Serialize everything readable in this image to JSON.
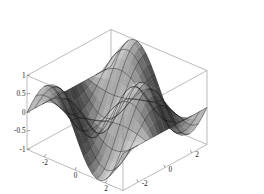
{
  "figure": {
    "kind": "3d-surface-plot",
    "background_color": "#ffffff",
    "box_line_color": "#8d8d8d",
    "mesh_line_color": "#151515",
    "surface_shade_light": "#cfcfcf",
    "surface_shade_dark": "#2a2a2a",
    "width": 264,
    "height": 194
  },
  "chart_data": {
    "type": "surface",
    "title": "",
    "xlabel": "",
    "ylabel": "",
    "zlabel": "",
    "grid": false,
    "legend": "none",
    "function": "sin(x) * cos(y)",
    "xlim": [
      -3.141592653589793,
      3.141592653589793
    ],
    "ylim": [
      -3.141592653589793,
      3.141592653589793
    ],
    "zlim": [
      -1,
      1
    ],
    "x_ticks": [
      -2,
      0,
      2
    ],
    "x_tick_labels": [
      "-2",
      "0",
      "2"
    ],
    "y_ticks": [
      -2,
      0,
      2
    ],
    "y_tick_labels": [
      "2",
      "0",
      "-2"
    ],
    "z_ticks": [
      1,
      0.5,
      0,
      -0.5,
      -1
    ],
    "z_tick_labels": [
      "1",
      "0.5",
      "0",
      "-0.5",
      "-1"
    ],
    "mesh_steps_x": 22,
    "mesh_steps_y": 22,
    "view": {
      "azimuth_deg": -37,
      "elevation_deg": 22
    }
  },
  "axes": {
    "z_axis": {
      "name": "z-axis",
      "ticks": [
        {
          "value": 1,
          "label": "1"
        },
        {
          "value": 0.5,
          "label": "0.5"
        },
        {
          "value": 0,
          "label": "0"
        },
        {
          "value": -0.5,
          "label": "-0.5"
        },
        {
          "value": -1,
          "label": "-1"
        }
      ]
    },
    "x_axis": {
      "name": "x-axis",
      "ticks": [
        {
          "value": -2,
          "label": "-2"
        },
        {
          "value": 0,
          "label": "0"
        },
        {
          "value": 2,
          "label": "2"
        }
      ]
    },
    "y_axis": {
      "name": "y-axis",
      "ticks": [
        {
          "value": 2,
          "label": "2"
        },
        {
          "value": 0,
          "label": "0"
        },
        {
          "value": -2,
          "label": "-2"
        }
      ]
    }
  }
}
